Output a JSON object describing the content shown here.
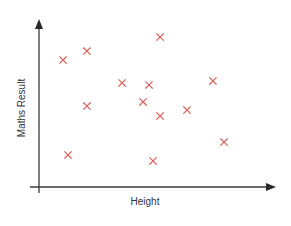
{
  "chart_data": {
    "type": "scatter",
    "title": "",
    "xlabel": "Height",
    "ylabel": "Maths Result",
    "xlim": [
      0,
      100
    ],
    "ylim": [
      0,
      100
    ],
    "grid": false,
    "legend": null,
    "ticks": false,
    "marker": "x",
    "marker_color": "#d9625b",
    "axis_color": "#3a3a3a",
    "series": [
      {
        "name": "students",
        "points": [
          {
            "x": 10.2,
            "y": 76.0
          },
          {
            "x": 20.3,
            "y": 81.4
          },
          {
            "x": 51.3,
            "y": 89.8
          },
          {
            "x": 35.2,
            "y": 62.3
          },
          {
            "x": 46.6,
            "y": 61.1
          },
          {
            "x": 73.7,
            "y": 63.5
          },
          {
            "x": 20.3,
            "y": 48.5
          },
          {
            "x": 44.1,
            "y": 50.9
          },
          {
            "x": 51.3,
            "y": 42.5
          },
          {
            "x": 62.7,
            "y": 46.1
          },
          {
            "x": 12.3,
            "y": 19.2
          },
          {
            "x": 48.3,
            "y": 15.6
          },
          {
            "x": 78.4,
            "y": 26.9
          }
        ]
      }
    ]
  }
}
